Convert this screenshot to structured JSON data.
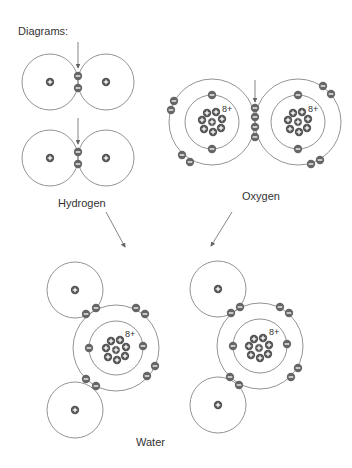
{
  "title": "Diagrams:",
  "labels": {
    "hydrogen": "Hydrogen",
    "oxygen": "Oxygen",
    "water": "Water"
  },
  "oxygen_charge": "8+",
  "colors": {
    "line": "#666666",
    "particle": "#555555",
    "text": "#333333"
  }
}
